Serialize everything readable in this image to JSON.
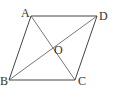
{
  "diagram": {
    "type": "parallelogram-with-diagonals",
    "vertices": {
      "A": {
        "label": "A",
        "x": 31,
        "y": 16
      },
      "B": {
        "label": "B",
        "x": 9,
        "y": 80
      },
      "C": {
        "label": "C",
        "x": 75,
        "y": 80
      },
      "D": {
        "label": "D",
        "x": 97,
        "y": 16
      }
    },
    "intersection": {
      "label": "O",
      "x": 53,
      "y": 48
    },
    "edges": [
      "AD",
      "DC",
      "CB",
      "BA"
    ],
    "diagonals": [
      "AC",
      "BD"
    ],
    "colors": {
      "line": "#444444",
      "text": "#333333",
      "background": "#ffffff"
    }
  }
}
